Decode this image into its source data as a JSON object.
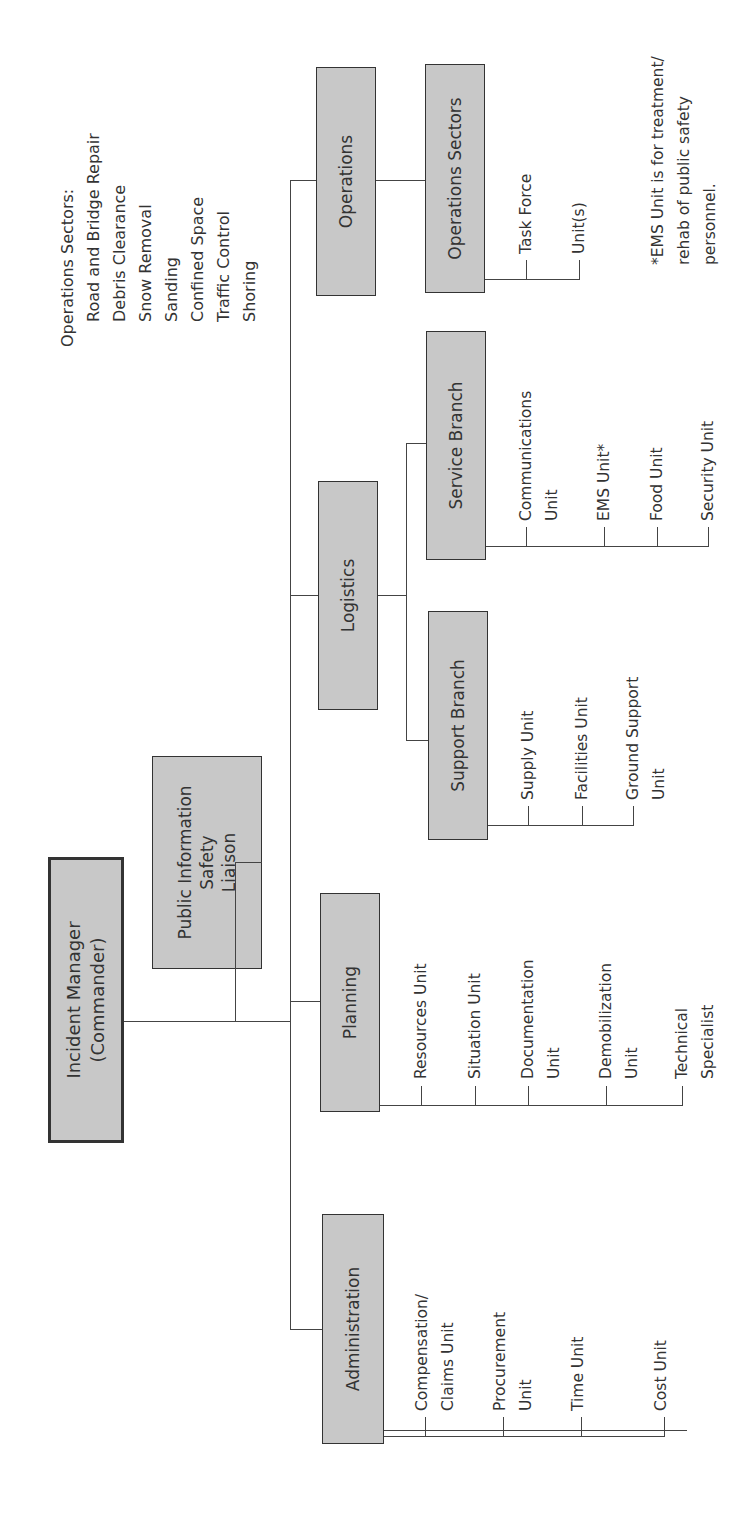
{
  "sidebar_note": {
    "title": "Operations Sectors:",
    "items": [
      "Road and Bridge Repair",
      "Debris Clearance",
      "Snow Removal",
      "Sanding",
      "Confined Space",
      "Traffic Control",
      "Shoring"
    ]
  },
  "org": {
    "root": {
      "label": "Incident Manager\n(Commander)"
    },
    "staff": {
      "label": "Public Information\nSafety\nLiaison"
    },
    "sections": {
      "administration": {
        "label": "Administration",
        "units": [
          "Compensation/\nClaims Unit",
          "Procurement\nUnit",
          "Time Unit",
          "Cost Unit"
        ]
      },
      "planning": {
        "label": "Planning",
        "units": [
          "Resources Unit",
          "Situation Unit",
          "Documentation\nUnit",
          "Demobilization\nUnit",
          "Technical\nSpecialist"
        ]
      },
      "logistics": {
        "label": "Logistics",
        "branches": {
          "support": {
            "label": "Support Branch",
            "units": [
              "Supply Unit",
              "Facilities Unit",
              "Ground Support\nUnit"
            ]
          },
          "service": {
            "label": "Service Branch",
            "units": [
              "Communications\nUnit",
              "EMS Unit*",
              "Food Unit",
              "Security Unit"
            ]
          }
        }
      },
      "operations": {
        "label": "Operations",
        "sectors": {
          "label": "Operations Sectors",
          "units": [
            "Task Force",
            "Unit(s)"
          ]
        }
      }
    }
  },
  "footnote": "*EMS Unit is for treatment/\nrehab of public safety\npersonnel.",
  "colors": {
    "box_fill": "#c8c8c8",
    "line": "#444444",
    "text": "#333333"
  }
}
